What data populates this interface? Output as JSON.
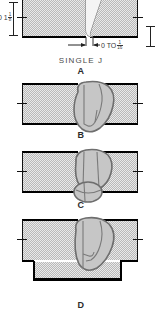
{
  "diagram": {
    "title_caption": "SINGLE J",
    "panels": [
      {
        "id": "A",
        "letter": "A",
        "caption": "SINGLE J",
        "type": "single-j-groove-dimensioned",
        "dimensions": [
          {
            "name": "root-face-dimension",
            "prefix": "0 1",
            "fraction_num": "1",
            "fraction_den": "8",
            "text": "0 1 1/8",
            "orientation": "vertical",
            "side": "left"
          },
          {
            "name": "root-opening-dimension",
            "text": "0 TO",
            "fraction_num": "1",
            "fraction_den": "16",
            "full_text": "0 TO 1/16",
            "orientation": "horizontal",
            "side": "bottom"
          }
        ]
      },
      {
        "id": "B",
        "letter": "B",
        "caption": "",
        "type": "weld-cross-section-plain",
        "backing": false
      },
      {
        "id": "C",
        "letter": "C",
        "caption": "",
        "type": "weld-cross-section-root-pass",
        "backing": false
      },
      {
        "id": "D",
        "letter": "D",
        "caption": "",
        "type": "weld-cross-section-backing-bar",
        "backing": true
      }
    ],
    "colors": {
      "plate_fill": "#e9e9e9",
      "plate_hatch": "#b9b9b9",
      "plate_edge": "#000000",
      "weld_fill": "#c6c6c6",
      "weld_outline": "#6e6e6e",
      "text": "#3a3a3a"
    }
  }
}
